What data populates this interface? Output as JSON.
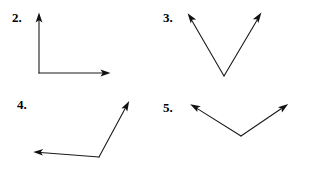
{
  "page": {
    "background_color": "#ffffff",
    "ink_color": "#1a1a1a",
    "width": 309,
    "height": 174
  },
  "problems": [
    {
      "number": "2.",
      "label_position": {
        "x": 12,
        "y": 11
      },
      "figure": {
        "type": "angle",
        "description": "right angle opening up and to the right",
        "vertex": {
          "x": 39,
          "y": 73
        },
        "rays": [
          {
            "name": "ray-up",
            "tip": {
              "x": 39,
              "y": 13
            }
          },
          {
            "name": "ray-right",
            "tip": {
              "x": 110,
              "y": 73
            }
          }
        ]
      }
    },
    {
      "number": "3.",
      "label_position": {
        "x": 163,
        "y": 11
      },
      "figure": {
        "type": "angle",
        "description": "acute angle opening upward, V shape",
        "vertex": {
          "x": 224,
          "y": 76
        },
        "rays": [
          {
            "name": "ray-upper-left",
            "tip": {
              "x": 188,
              "y": 14
            }
          },
          {
            "name": "ray-upper-right",
            "tip": {
              "x": 261,
              "y": 13
            }
          }
        ]
      }
    },
    {
      "number": "4.",
      "label_position": {
        "x": 17,
        "y": 98
      },
      "figure": {
        "type": "angle",
        "description": "obtuse angle opening up and to the left",
        "vertex": {
          "x": 99,
          "y": 157
        },
        "rays": [
          {
            "name": "ray-left",
            "tip": {
              "x": 33,
              "y": 152
            }
          },
          {
            "name": "ray-upper-right",
            "tip": {
              "x": 129,
              "y": 101
            }
          }
        ]
      }
    },
    {
      "number": "5.",
      "label_position": {
        "x": 163,
        "y": 101
      },
      "figure": {
        "type": "angle",
        "description": "obtuse angle opening upward, shallow V shape",
        "vertex": {
          "x": 241,
          "y": 136
        },
        "rays": [
          {
            "name": "ray-upper-left",
            "tip": {
              "x": 190,
              "y": 104
            }
          },
          {
            "name": "ray-upper-right",
            "tip": {
              "x": 288,
              "y": 104
            }
          }
        ]
      }
    }
  ]
}
